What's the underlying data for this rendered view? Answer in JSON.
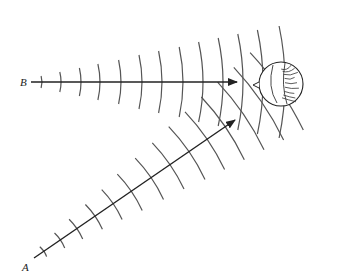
{
  "diagram": {
    "title": "",
    "sources": [
      {
        "id": "A",
        "label": "A",
        "label_pos": [
          22,
          261
        ],
        "origin": [
          34,
          258
        ],
        "tip": [
          235,
          120
        ]
      },
      {
        "id": "B",
        "label": "B",
        "label_pos": [
          20,
          76
        ],
        "origin": [
          31,
          82
        ],
        "tip": [
          237,
          82
        ]
      }
    ],
    "object": {
      "name": "sphere-target",
      "center": [
        281,
        84
      ],
      "radius": 22
    },
    "colors": {
      "line": "#222222",
      "wave": "#555555",
      "background": "#ffffff"
    },
    "waves": {
      "B": {
        "distances": [
          11,
          30,
          50,
          69,
          90,
          111,
          131,
          152,
          172,
          192,
          212,
          232,
          254
        ],
        "half_heights": [
          6,
          10,
          14,
          18,
          22,
          27,
          31,
          35,
          40,
          44,
          48,
          52,
          56
        ]
      },
      "A": {
        "distances": [
          12,
          32,
          52,
          74,
          96,
          118,
          142,
          165,
          188,
          210,
          232,
          254,
          276,
          298
        ],
        "half_heights": [
          6,
          9,
          12,
          15,
          18,
          22,
          25,
          28,
          32,
          35,
          38,
          41,
          44,
          47
        ]
      }
    }
  }
}
